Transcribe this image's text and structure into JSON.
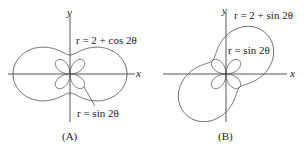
{
  "panels": [
    {
      "id": "A",
      "caption": "(A)",
      "axis_x_label": "x",
      "axis_y_label": "y",
      "curve_outer_label": "r = 2 + cos 2θ",
      "curve_inner_label": "r = sin 2θ",
      "outer_equation": "r = 2 + cos 2θ",
      "inner_equation": "r = sin 2θ"
    },
    {
      "id": "B",
      "caption": "(B)",
      "axis_x_label": "x",
      "axis_y_label": "y",
      "curve_outer_label": "r = 2 + sin 2θ",
      "curve_inner_label": "r = sin 2θ",
      "outer_equation": "r = 2 + sin 2θ",
      "inner_equation": "r = sin 2θ"
    }
  ],
  "colors": {
    "stroke": "#555555",
    "text": "#222222"
  }
}
